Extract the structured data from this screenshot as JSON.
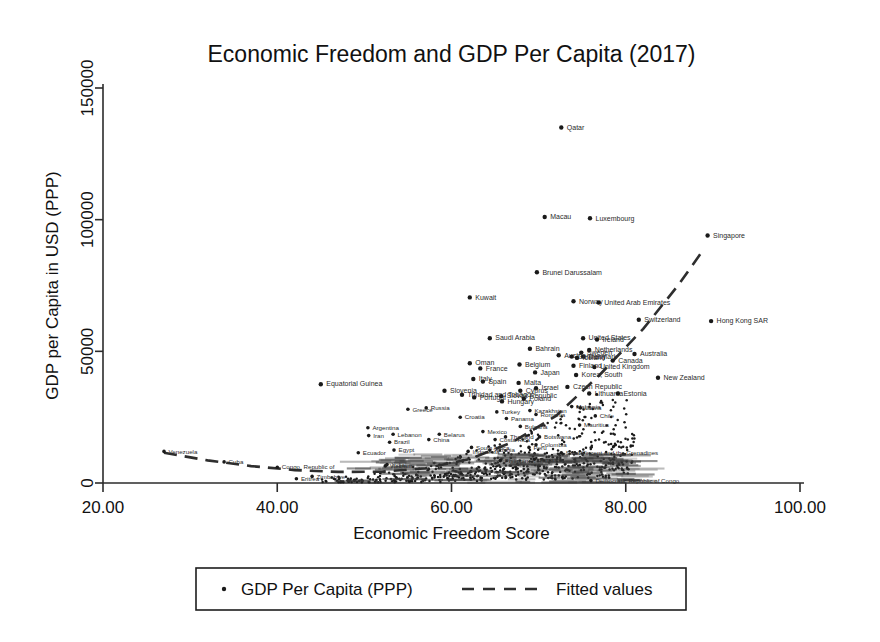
{
  "chart_data": {
    "type": "scatter",
    "title": "Economic Freedom and GDP Per Capita (2017)",
    "xlabel": "Economic Freedom Score",
    "ylabel": "GDP per Capita in USD (PPP)",
    "xlim": [
      20,
      100
    ],
    "ylim": [
      0,
      150000
    ],
    "xticks": [
      "20.00",
      "40.00",
      "60.00",
      "80.00",
      "100.00"
    ],
    "xtick_values": [
      20,
      40,
      60,
      80,
      100
    ],
    "yticks": [
      "0",
      "50000",
      "100000",
      "150000"
    ],
    "ytick_values": [
      0,
      50000,
      100000,
      150000
    ],
    "grid": false,
    "legend_position": "bottom",
    "legend": [
      {
        "label": "GDP Per Capita (PPP)",
        "marker": "dot"
      },
      {
        "label": "Fitted values",
        "marker": "dashed-line"
      }
    ],
    "series": [
      {
        "name": "GDP Per Capita (PPP)",
        "marker": "dot",
        "points": [
          {
            "label": "Qatar",
            "x": 72.6,
            "y": 135000
          },
          {
            "label": "Macau",
            "x": 70.7,
            "y": 101000
          },
          {
            "label": "Luxembourg",
            "x": 75.9,
            "y": 100500
          },
          {
            "label": "Singapore",
            "x": 89.4,
            "y": 94000
          },
          {
            "label": "Brunei Darussalam",
            "x": 69.8,
            "y": 80000
          },
          {
            "label": "Kuwait",
            "x": 62.1,
            "y": 70500
          },
          {
            "label": "Norway",
            "x": 74.0,
            "y": 69000
          },
          {
            "label": "United Arab Emirates",
            "x": 76.9,
            "y": 68500
          },
          {
            "label": "Switzerland",
            "x": 81.5,
            "y": 62000
          },
          {
            "label": "Hong Kong SAR",
            "x": 89.8,
            "y": 61500
          },
          {
            "label": "Saudi Arabia",
            "x": 64.4,
            "y": 55000
          },
          {
            "label": "United States",
            "x": 75.1,
            "y": 55000
          },
          {
            "label": "Ireland",
            "x": 76.7,
            "y": 54500
          },
          {
            "label": "Bahrain",
            "x": 69.0,
            "y": 51000
          },
          {
            "label": "Netherlands",
            "x": 75.8,
            "y": 50500
          },
          {
            "label": "Sweden",
            "x": 74.9,
            "y": 49500
          },
          {
            "label": "Australia",
            "x": 81.0,
            "y": 49000
          },
          {
            "label": "Austria",
            "x": 72.3,
            "y": 48500
          },
          {
            "label": "Denmark",
            "x": 75.1,
            "y": 48000
          },
          {
            "label": "Germany",
            "x": 73.8,
            "y": 48000
          },
          {
            "label": "Iceland",
            "x": 74.4,
            "y": 47500
          },
          {
            "label": "Canada",
            "x": 78.5,
            "y": 46500
          },
          {
            "label": "Oman",
            "x": 62.1,
            "y": 45500
          },
          {
            "label": "Belgium",
            "x": 67.8,
            "y": 45000
          },
          {
            "label": "Finland",
            "x": 74.0,
            "y": 44500
          },
          {
            "label": "United Kingdom",
            "x": 76.4,
            "y": 44000
          },
          {
            "label": "France",
            "x": 63.3,
            "y": 43500
          },
          {
            "label": "Japan",
            "x": 69.6,
            "y": 42000
          },
          {
            "label": "Korea, South",
            "x": 74.3,
            "y": 41000
          },
          {
            "label": "New Zealand",
            "x": 83.7,
            "y": 40000
          },
          {
            "label": "Italy",
            "x": 62.5,
            "y": 39500
          },
          {
            "label": "Spain",
            "x": 63.6,
            "y": 38500
          },
          {
            "label": "Malta",
            "x": 67.7,
            "y": 38000
          },
          {
            "label": "Equatorial Guinea",
            "x": 45.0,
            "y": 37500
          },
          {
            "label": "Czech Republic",
            "x": 73.3,
            "y": 36500
          },
          {
            "label": "Israel",
            "x": 69.7,
            "y": 36000
          },
          {
            "label": "Slovenia",
            "x": 59.2,
            "y": 35000
          },
          {
            "label": "Cyprus",
            "x": 67.9,
            "y": 35000
          },
          {
            "label": "Lithuania",
            "x": 75.8,
            "y": 34000
          },
          {
            "label": "Estonia",
            "x": 79.1,
            "y": 34000
          },
          {
            "label": "Trinidad and Tobago",
            "x": 61.2,
            "y": 33500
          },
          {
            "label": "Slovak Republic",
            "x": 65.7,
            "y": 33000
          },
          {
            "label": "Portugal",
            "x": 62.6,
            "y": 32500
          },
          {
            "label": "Poland",
            "x": 68.3,
            "y": 32000
          },
          {
            "label": "Hungary",
            "x": 65.8,
            "y": 31000
          },
          {
            "label": "Russia",
            "x": 57.1,
            "y": 28500
          },
          {
            "label": "Greece",
            "x": 55.0,
            "y": 28000
          },
          {
            "label": "Malaysia",
            "x": 73.8,
            "y": 29000
          },
          {
            "label": "Kazakhstan",
            "x": 69.0,
            "y": 27500
          },
          {
            "label": "Latvia",
            "x": 74.8,
            "y": 28500
          },
          {
            "label": "Chile",
            "x": 76.5,
            "y": 25500
          },
          {
            "label": "Turkey",
            "x": 65.2,
            "y": 27000
          },
          {
            "label": "Romania",
            "x": 69.7,
            "y": 26000
          },
          {
            "label": "Croatia",
            "x": 61.0,
            "y": 25000
          },
          {
            "label": "Panama",
            "x": 66.3,
            "y": 24500
          },
          {
            "label": "Mauritius",
            "x": 74.7,
            "y": 22000
          },
          {
            "label": "Argentina",
            "x": 50.4,
            "y": 21000
          },
          {
            "label": "Bulgaria",
            "x": 67.9,
            "y": 21500
          },
          {
            "label": "Belarus",
            "x": 58.6,
            "y": 18500
          },
          {
            "label": "Mexico",
            "x": 63.6,
            "y": 19500
          },
          {
            "label": "Lebanon",
            "x": 53.3,
            "y": 18500
          },
          {
            "label": "Iran",
            "x": 50.5,
            "y": 18000
          },
          {
            "label": "Thailand",
            "x": 66.2,
            "y": 17500
          },
          {
            "label": "Botswana",
            "x": 70.1,
            "y": 17500
          },
          {
            "label": "Costa Rica",
            "x": 65.0,
            "y": 16500
          },
          {
            "label": "Albania",
            "x": 64.4,
            "y": 12500
          },
          {
            "label": "China",
            "x": 57.4,
            "y": 16500
          },
          {
            "label": "Brazil",
            "x": 52.9,
            "y": 15500
          },
          {
            "label": "Venezuela",
            "x": 27.0,
            "y": 12000
          },
          {
            "label": "Cuba",
            "x": 33.9,
            "y": 8000
          },
          {
            "label": "Colombia",
            "x": 69.7,
            "y": 14500
          },
          {
            "label": "South Africa",
            "x": 62.3,
            "y": 13500
          },
          {
            "label": "Ecuador",
            "x": 49.3,
            "y": 11500
          },
          {
            "label": "Peru",
            "x": 68.9,
            "y": 13500
          },
          {
            "label": "Egypt",
            "x": 53.4,
            "y": 12500
          },
          {
            "label": "Saint Vincent and the Grenadines",
            "x": 72.6,
            "y": 11500
          },
          {
            "label": "Indonesia",
            "x": 61.9,
            "y": 12000
          },
          {
            "label": "Jamaica",
            "x": 69.5,
            "y": 9000
          },
          {
            "label": "Philippines",
            "x": 65.6,
            "y": 8500
          },
          {
            "label": "Vietnam",
            "x": 52.4,
            "y": 6500
          },
          {
            "label": "India",
            "x": 52.6,
            "y": 7000
          },
          {
            "label": "Congo, Republic of",
            "x": 40.0,
            "y": 6000
          },
          {
            "label": "Zimbabwe",
            "x": 44.0,
            "y": 2500
          },
          {
            "label": "Eritrea",
            "x": 42.2,
            "y": 1600
          },
          {
            "label": "Democratic Republic of Congo",
            "x": 76.0,
            "y": 900
          }
        ],
        "unlabeled_cluster_note": "Approximately 180 total countries; dense unlabeled mass between x=45 and x=80 below y=20000"
      }
    ],
    "fitted_curve": {
      "name": "Fitted values",
      "style": "dashed",
      "shape": "quadratic",
      "points": [
        {
          "x": 27.0,
          "y": 11500
        },
        {
          "x": 32.0,
          "y": 8600
        },
        {
          "x": 37.0,
          "y": 6400
        },
        {
          "x": 42.0,
          "y": 4900
        },
        {
          "x": 47.0,
          "y": 4200
        },
        {
          "x": 52.0,
          "y": 4300
        },
        {
          "x": 57.0,
          "y": 5600
        },
        {
          "x": 62.0,
          "y": 9000
        },
        {
          "x": 67.0,
          "y": 15500
        },
        {
          "x": 72.0,
          "y": 25500
        },
        {
          "x": 77.0,
          "y": 41000
        },
        {
          "x": 82.0,
          "y": 58500
        },
        {
          "x": 86.0,
          "y": 75000
        },
        {
          "x": 89.0,
          "y": 89000
        }
      ]
    }
  },
  "colors": {
    "background": "#ffffff",
    "ink": "#1a1a1a",
    "axis": "#2b2b2b",
    "fit_line": "#2e2e2e"
  }
}
